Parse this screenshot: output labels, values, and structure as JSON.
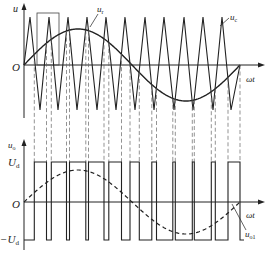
{
  "diagram": {
    "type": "SPWM waveform (bipolar)",
    "top_plot": {
      "y_axis_label": "u",
      "origin_label": "O",
      "x_axis_label": "ωt",
      "carrier_label": "u",
      "carrier_sub": "c",
      "reference_label": "u",
      "reference_sub": "r"
    },
    "bottom_plot": {
      "y_axis_label": "u",
      "y_axis_sub": "o",
      "origin_label": "O",
      "x_axis_label": "ωt",
      "high_level_label": "U",
      "high_level_sub": "d",
      "low_level_label": "−U",
      "low_level_sub": "d",
      "fundamental_label": "u",
      "fundamental_sub": "o1"
    },
    "colors": {
      "stroke": "#222222",
      "dashed": "#555555",
      "background": "#ffffff"
    }
  },
  "chart_data": {
    "type": "line",
    "title": "",
    "series": [
      {
        "name": "u_c (triangular carrier)",
        "style": "solid",
        "peaks_x_px": [
          30,
          49,
          68,
          87,
          106,
          125,
          145,
          164,
          184,
          203,
          222
        ],
        "troughs_x_px": [
          40,
          58,
          77,
          97,
          116,
          135,
          154,
          174,
          193,
          213,
          231
        ],
        "amplitude": 1.0
      },
      {
        "name": "u_r (sinusoidal reference)",
        "style": "solid",
        "start_x_px": 24,
        "end_x_px": 240,
        "amplitude": 0.8
      },
      {
        "name": "u_o (PWM output)",
        "style": "solid",
        "levels": [
          "U_d",
          "-U_d"
        ]
      },
      {
        "name": "u_o1 (fundamental)",
        "style": "dashed",
        "amplitude": 0.8
      }
    ],
    "xlabel": "ωt",
    "ylabel_top": "u",
    "ylabel_bottom": "u_o",
    "yticks_bottom": [
      "U_d",
      "O",
      "-U_d"
    ]
  }
}
